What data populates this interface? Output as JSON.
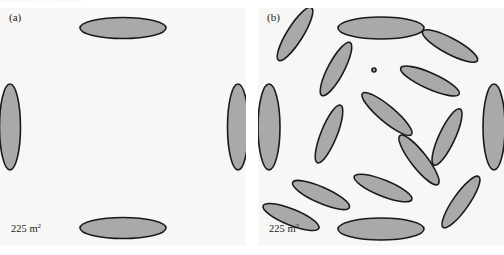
{
  "figure": {
    "bleed_text": ". . . . . . . . . . .  . . . . .      . .        . .",
    "ellipse_fill": "#a9a9a9",
    "ellipse_stroke": "#1a1a1a",
    "panel_background": "#f7f7f5",
    "page_background": "#ffffff",
    "panel_width": 246,
    "panel_height": 238
  },
  "panels": [
    {
      "id": "panel-a",
      "label": "(a)",
      "area_value": "225 m",
      "area_exponent": "2",
      "ellipse_count": 4,
      "description": "aligned",
      "ellipses": [
        {
          "cx": 123,
          "cy": 20,
          "rx": 43,
          "ry": 10.5,
          "angle": 0
        },
        {
          "cx": 123,
          "cy": 220,
          "rx": 43,
          "ry": 10.5,
          "angle": 0
        },
        {
          "cx": 10,
          "cy": 119,
          "rx": 10.5,
          "ry": 43,
          "angle": 0
        },
        {
          "cx": 238,
          "cy": 119,
          "rx": 10.5,
          "ry": 43,
          "angle": 0
        }
      ]
    },
    {
      "id": "panel-b",
      "label": "(b)",
      "area_value": "225 m",
      "area_exponent": "2",
      "ellipse_count": 17,
      "description": "random",
      "ellipses": [
        {
          "cx": 123,
          "cy": 20,
          "rx": 43,
          "ry": 11,
          "angle": 0
        },
        {
          "cx": 123,
          "cy": 221,
          "rx": 43,
          "ry": 11,
          "angle": 0
        },
        {
          "cx": 11,
          "cy": 119,
          "rx": 11,
          "ry": 43,
          "angle": 0
        },
        {
          "cx": 236,
          "cy": 119,
          "rx": 11,
          "ry": 43,
          "angle": 0
        },
        {
          "cx": 37,
          "cy": 26,
          "rx": 31,
          "ry": 8,
          "angle": -58
        },
        {
          "cx": 78,
          "cy": 61,
          "rx": 30,
          "ry": 8,
          "angle": -62
        },
        {
          "cx": 192,
          "cy": 38,
          "rx": 31,
          "ry": 8,
          "angle": 28
        },
        {
          "cx": 172,
          "cy": 73,
          "rx": 32,
          "ry": 8,
          "angle": 24
        },
        {
          "cx": 129,
          "cy": 106,
          "rx": 32,
          "ry": 8,
          "angle": 40
        },
        {
          "cx": 71,
          "cy": 126,
          "rx": 31,
          "ry": 8,
          "angle": -68
        },
        {
          "cx": 189,
          "cy": 129,
          "rx": 31,
          "ry": 8,
          "angle": -65
        },
        {
          "cx": 161,
          "cy": 152,
          "rx": 31,
          "ry": 8,
          "angle": 52
        },
        {
          "cx": 63,
          "cy": 187,
          "rx": 31,
          "ry": 8,
          "angle": 24
        },
        {
          "cx": 125,
          "cy": 180,
          "rx": 31,
          "ry": 8,
          "angle": 22
        },
        {
          "cx": 203,
          "cy": 194,
          "rx": 31,
          "ry": 8,
          "angle": -55
        },
        {
          "cx": 33,
          "cy": 209,
          "rx": 30,
          "ry": 8,
          "angle": 22
        },
        {
          "cx": 116,
          "cy": 62,
          "rx": 2,
          "ry": 2,
          "angle": 0
        }
      ]
    }
  ]
}
